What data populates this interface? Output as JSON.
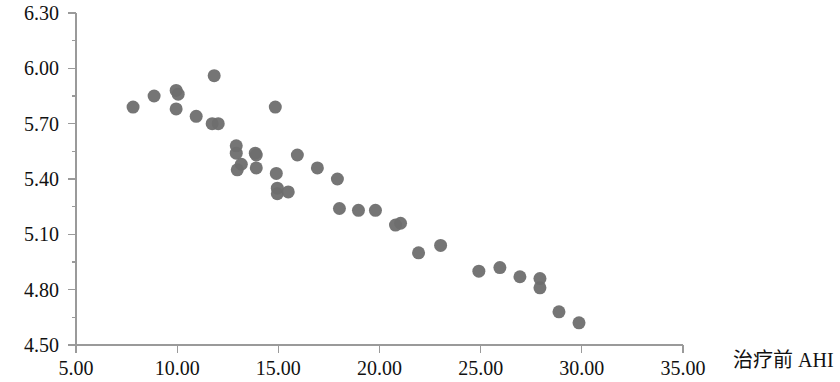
{
  "chart_data": {
    "type": "scatter",
    "title": "",
    "subtitle": "",
    "xlabel": "治疗前 AHI",
    "ylabel": "",
    "xlim": [
      5.0,
      35.0
    ],
    "ylim": [
      4.5,
      6.3
    ],
    "grid": false,
    "legend": null,
    "legend_position": "none",
    "x_ticks": [
      5.0,
      10.0,
      15.0,
      20.0,
      25.0,
      30.0,
      35.0
    ],
    "x_tick_labels": [
      "5.00",
      "10.00",
      "15.00",
      "20.00",
      "25.00",
      "30.00",
      "35.00"
    ],
    "y_ticks": [
      4.5,
      4.8,
      5.1,
      5.4,
      5.7,
      6.0,
      6.3
    ],
    "y_tick_labels": [
      "4.50",
      "4.80",
      "5.10",
      "5.40",
      "5.70",
      "6.00",
      "6.30"
    ],
    "y_minor_ticks": [
      4.65,
      4.95,
      5.25,
      5.55,
      5.85,
      6.15
    ],
    "marker": {
      "shape": "circle",
      "color": "#6e6e6e",
      "size": 13,
      "opacity": 0.95
    },
    "point_count": 38,
    "points": [
      {
        "x": 7.82,
        "y": 5.79
      },
      {
        "x": 8.86,
        "y": 5.85
      },
      {
        "x": 9.95,
        "y": 5.88
      },
      {
        "x": 9.95,
        "y": 5.78
      },
      {
        "x": 10.94,
        "y": 5.74
      },
      {
        "x": 11.73,
        "y": 5.7
      },
      {
        "x": 11.83,
        "y": 5.96
      },
      {
        "x": 12.03,
        "y": 5.7
      },
      {
        "x": 12.92,
        "y": 5.58
      },
      {
        "x": 12.92,
        "y": 5.54
      },
      {
        "x": 13.17,
        "y": 5.48
      },
      {
        "x": 13.86,
        "y": 5.54
      },
      {
        "x": 13.91,
        "y": 5.46
      },
      {
        "x": 14.9,
        "y": 5.43
      },
      {
        "x": 14.95,
        "y": 5.35
      },
      {
        "x": 14.95,
        "y": 5.32
      },
      {
        "x": 14.85,
        "y": 5.79
      },
      {
        "x": 15.94,
        "y": 5.53
      },
      {
        "x": 16.93,
        "y": 5.46
      },
      {
        "x": 17.92,
        "y": 5.4
      },
      {
        "x": 18.02,
        "y": 5.24
      },
      {
        "x": 18.96,
        "y": 5.23
      },
      {
        "x": 19.8,
        "y": 5.23
      },
      {
        "x": 21.93,
        "y": 5.0
      },
      {
        "x": 21.04,
        "y": 5.16
      },
      {
        "x": 23.02,
        "y": 5.04
      },
      {
        "x": 24.91,
        "y": 4.9
      },
      {
        "x": 25.95,
        "y": 4.92
      },
      {
        "x": 26.94,
        "y": 4.87
      },
      {
        "x": 27.93,
        "y": 4.86
      },
      {
        "x": 27.93,
        "y": 4.81
      },
      {
        "x": 28.87,
        "y": 4.68
      },
      {
        "x": 29.86,
        "y": 4.62
      },
      {
        "x": 13.91,
        "y": 5.53
      },
      {
        "x": 15.49,
        "y": 5.33
      },
      {
        "x": 10.05,
        "y": 5.86
      },
      {
        "x": 12.97,
        "y": 5.45
      },
      {
        "x": 20.79,
        "y": 5.15
      }
    ]
  },
  "axes": {
    "x_axis_name": "治疗前 AHI",
    "y_axis_name": ""
  },
  "colors": {
    "marker": "#6e6e6e",
    "axis": "#9a9a9a",
    "text": "#111111",
    "background": "#ffffff"
  }
}
